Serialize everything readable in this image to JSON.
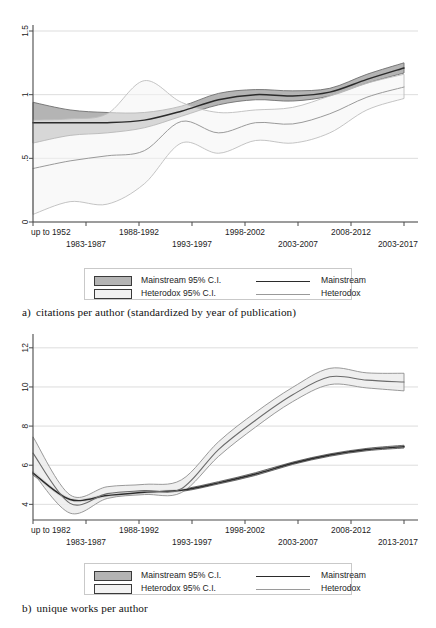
{
  "figure": {
    "panels": [
      {
        "id": "a",
        "caption_letter": "a)",
        "caption_text": "citations per author (standardized by year of publication)",
        "chart_data": {
          "type": "line",
          "title": "",
          "xlabel": "",
          "ylabel": "",
          "ylim": [
            0,
            1.5
          ],
          "yticks": [
            0,
            0.5,
            1,
            1.5
          ],
          "ytick_labels": [
            "0",
            ".5",
            "1",
            "1.5"
          ],
          "grid": true,
          "legend_position": "below",
          "categories": [
            "up to 1952",
            "1983-1987",
            "1988-1992",
            "1993-1997",
            "1998-2002",
            "2003-2007",
            "2008-2012",
            "2003-2017"
          ],
          "xtick_labels_row1": [
            "up to 1952",
            "1988-1992",
            "1998-2002",
            "2008-2012"
          ],
          "xtick_labels_row2": [
            "1983-1987",
            "1993-1997",
            "2003-2007",
            "2003-2017"
          ],
          "x": [
            0,
            1,
            2,
            3,
            4,
            5,
            6,
            7,
            8,
            9,
            10
          ],
          "series": [
            {
              "name": "Mainstream",
              "color": "#2b2b2b",
              "values": [
                0.78,
                0.78,
                0.78,
                0.8,
                0.87,
                0.96,
                1.0,
                0.99,
                1.02,
                1.12,
                1.21
              ]
            },
            {
              "name": "Heterodox",
              "color": "#9a9a9a",
              "values": [
                0.42,
                0.48,
                0.52,
                0.56,
                0.79,
                0.7,
                0.78,
                0.77,
                0.85,
                0.98,
                1.06
              ]
            }
          ],
          "bands": [
            {
              "name": "Mainstream 95% C.I.",
              "fill": "#b4b4b4",
              "lower": [
                0.62,
                0.68,
                0.7,
                0.74,
                0.83,
                0.92,
                0.96,
                0.95,
                0.99,
                1.09,
                1.17
              ],
              "upper": [
                0.94,
                0.88,
                0.86,
                0.86,
                0.91,
                1.01,
                1.04,
                1.03,
                1.05,
                1.16,
                1.25
              ]
            },
            {
              "name": "Heterodox 95% C.I.",
              "fill": "#f4f4f4",
              "lower": [
                0.06,
                0.16,
                0.14,
                0.3,
                0.62,
                0.54,
                0.64,
                0.62,
                0.7,
                0.88,
                0.97
              ],
              "upper": [
                0.8,
                0.81,
                0.85,
                1.11,
                0.94,
                0.86,
                0.88,
                0.9,
                0.99,
                1.09,
                1.16
              ]
            }
          ]
        },
        "legend": {
          "rows": [
            {
              "swatch": "mainstream-ci",
              "label": "Mainstream 95% C.I.",
              "line": "mainstream",
              "line_label": "Mainstream"
            },
            {
              "swatch": "heterodox-ci",
              "label": "Heterodox 95% C.I.",
              "line": "heterodox",
              "line_label": "Heterodox"
            }
          ]
        }
      },
      {
        "id": "b",
        "caption_letter": "b)",
        "caption_text": "unique works per author",
        "chart_data": {
          "type": "line",
          "title": "",
          "xlabel": "",
          "ylabel": "",
          "ylim": [
            3.2,
            12.4
          ],
          "yticks": [
            4,
            6,
            8,
            10,
            12
          ],
          "ytick_labels": [
            "4",
            "6",
            "8",
            "10",
            "12"
          ],
          "grid": true,
          "legend_position": "below",
          "categories": [
            "up to 1982",
            "1983-1987",
            "1988-1992",
            "1993-1997",
            "1998-2002",
            "2003-2007",
            "2008-2012",
            "2013-2017"
          ],
          "xtick_labels_row1": [
            "up to 1982",
            "1988-1992",
            "1998-2002",
            "2008-2012"
          ],
          "xtick_labels_row2": [
            "1983-1987",
            "1993-1997",
            "2003-2007",
            "2013-2017"
          ],
          "x": [
            0,
            1,
            2,
            3,
            4,
            5,
            6,
            7,
            8,
            9,
            10
          ],
          "series": [
            {
              "name": "Mainstream",
              "color": "#2b2b2b",
              "values": [
                5.6,
                4.25,
                4.45,
                4.62,
                4.72,
                5.1,
                5.55,
                6.1,
                6.52,
                6.8,
                6.95
              ]
            },
            {
              "name": "Heterodox",
              "color": "#6b6b6b",
              "values": [
                6.62,
                4.05,
                4.55,
                4.7,
                4.8,
                6.8,
                8.3,
                9.6,
                10.52,
                10.35,
                10.25
              ]
            }
          ],
          "bands": [
            {
              "name": "Mainstream 95% C.I.",
              "fill": "#c8c8c8",
              "lower": [
                5.5,
                4.18,
                4.38,
                4.56,
                4.66,
                5.04,
                5.48,
                6.04,
                6.46,
                6.74,
                6.88
              ],
              "upper": [
                5.7,
                4.32,
                4.52,
                4.68,
                4.78,
                5.16,
                5.62,
                6.16,
                6.58,
                6.86,
                7.02
              ]
            },
            {
              "name": "Heterodox 95% C.I.",
              "fill": "#ececec",
              "lower": [
                5.62,
                3.55,
                4.3,
                4.5,
                4.6,
                6.45,
                7.95,
                9.25,
                10.12,
                9.95,
                9.8
              ],
              "upper": [
                7.45,
                4.48,
                4.9,
                5.02,
                5.25,
                7.2,
                8.7,
                9.98,
                10.95,
                10.72,
                10.7
              ]
            }
          ]
        },
        "legend": {
          "rows": [
            {
              "swatch": "mainstream-ci",
              "label": "Mainstream 95% C.I.",
              "line": "mainstream",
              "line_label": "Mainstream"
            },
            {
              "swatch": "heterodox-ci",
              "label": "Heterodox 95% C.I.",
              "line": "heterodox",
              "line_label": "Heterodox"
            }
          ]
        }
      }
    ]
  }
}
